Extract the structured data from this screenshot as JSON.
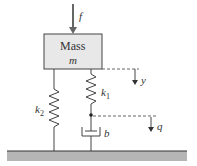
{
  "diagram": {
    "mass_label": "Mass",
    "mass_symbol": "m",
    "force_label": "f",
    "spring1_label": "k",
    "spring1_sub": "1",
    "spring2_label": "k",
    "spring2_sub": "2",
    "damper_label": "b",
    "disp_y_label": "y",
    "disp_q_label": "q",
    "colors": {
      "mass_fill": "#e8e8e8",
      "ground": "#b5b5b5",
      "line": "#444444"
    }
  }
}
